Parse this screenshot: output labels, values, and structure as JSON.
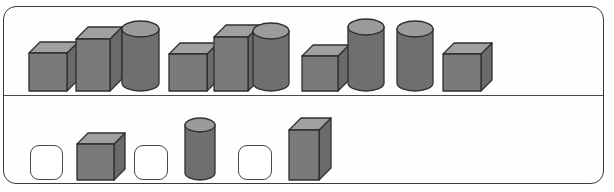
{
  "panel": {
    "title": "shape sequence panel",
    "background_color": "#fefefe",
    "border_color": "#3a3a3a",
    "divider_color": "#4a4a4a"
  },
  "palette": {
    "front_face": "#7a7a7a",
    "top_face": "#a0a0a0",
    "side_face": "#6a6a6a",
    "outline": "#2f2f2f",
    "cylinder_body": "#6f6f6f",
    "cylinder_top": "#9b9b9b",
    "placeholder_fill": "#ffffff",
    "placeholder_border": "#4a4a4a"
  },
  "rows": [
    {
      "name": "sequence-row",
      "label": "Top sequence row",
      "items": [
        {
          "kind": "cube",
          "label": "small cube",
          "x": 28,
          "w": 38,
          "h": 38,
          "depth": 11
        },
        {
          "kind": "box",
          "label": "tall box",
          "x": 75,
          "w": 34,
          "h": 52,
          "depth": 12
        },
        {
          "kind": "cylinder",
          "label": "tall cylinder",
          "x": 121,
          "w": 37,
          "h": 62,
          "depth": 10
        },
        {
          "kind": "cube",
          "label": "small cube",
          "x": 168,
          "w": 38,
          "h": 37,
          "depth": 11
        },
        {
          "kind": "box",
          "label": "tall box",
          "x": 213,
          "w": 34,
          "h": 54,
          "depth": 12
        },
        {
          "kind": "cylinder",
          "label": "tall cylinder",
          "x": 252,
          "w": 36,
          "h": 60,
          "depth": 10
        },
        {
          "kind": "cube",
          "label": "small cube",
          "x": 301,
          "w": 36,
          "h": 35,
          "depth": 11
        },
        {
          "kind": "cylinder",
          "label": "tall cylinder",
          "x": 347,
          "w": 36,
          "h": 64,
          "depth": 10
        },
        {
          "kind": "cylinder",
          "label": "tall cylinder",
          "x": 396,
          "w": 36,
          "h": 62,
          "depth": 10
        },
        {
          "kind": "cube",
          "label": "small cube",
          "x": 442,
          "w": 38,
          "h": 37,
          "depth": 11
        }
      ]
    },
    {
      "name": "answer-row",
      "label": "Bottom answer row",
      "items": [
        {
          "kind": "placeholder",
          "label": "empty answer slot 1",
          "x": 30,
          "w": 33,
          "h": 35
        },
        {
          "kind": "cube",
          "label": "small cube",
          "x": 76,
          "w": 37,
          "h": 36,
          "depth": 11
        },
        {
          "kind": "placeholder",
          "label": "empty answer slot 2",
          "x": 134,
          "w": 34,
          "h": 35
        },
        {
          "kind": "cylinder",
          "label": "tall cylinder",
          "x": 184,
          "w": 30,
          "h": 55,
          "depth": 9
        },
        {
          "kind": "placeholder",
          "label": "empty answer slot 3",
          "x": 238,
          "w": 34,
          "h": 35
        },
        {
          "kind": "box",
          "label": "tall box",
          "x": 288,
          "w": 30,
          "h": 50,
          "depth": 12
        }
      ]
    }
  ]
}
